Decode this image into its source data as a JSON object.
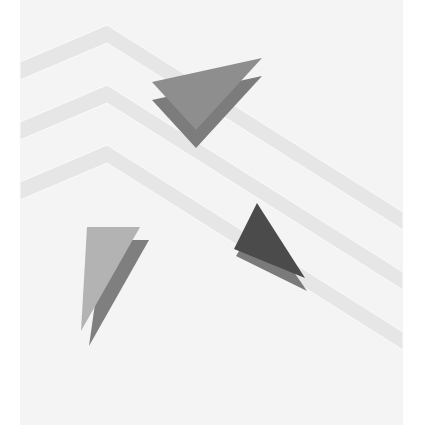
{
  "illustration": {
    "width": 429,
    "height": 443,
    "background_color": "#ffffff",
    "panel": {
      "x": 20,
      "y": 0,
      "width": 383,
      "height": 425,
      "color": "#f4f4f4"
    },
    "stripe_color": "#e6e6e6",
    "stripe_edge_color": "#fbfbfb",
    "stripes": [
      {
        "name": "stripe-1",
        "points": "20,62 107,25 403,212 403,230 107,43 20,80"
      },
      {
        "name": "stripe-2",
        "points": "20,122 107,85 403,272 403,290 107,103 20,140"
      },
      {
        "name": "stripe-3",
        "points": "20,182 107,145 403,332 403,350 107,163 20,200"
      }
    ],
    "triangle_groups": [
      {
        "name": "top-triangle-group",
        "back": {
          "points": "152,100 262,76 196,148",
          "color": "#7c7c7c"
        },
        "front": {
          "points": "152,82 262,58 196,130",
          "color": "#8e8e8e"
        }
      },
      {
        "name": "right-triangle-group",
        "back": {
          "points": "236,256 258,220 307,291",
          "color": "#7a7a7a"
        },
        "front": {
          "points": "257,203 234,249 305,278",
          "color": "#4b4b4b"
        }
      },
      {
        "name": "left-triangle-group",
        "back": {
          "points": "104,240 149,240 89,346",
          "color": "#7f7f7f"
        },
        "front": {
          "points": "87,227 140,227 81,331",
          "color": "#b3b3b3"
        }
      }
    ]
  }
}
